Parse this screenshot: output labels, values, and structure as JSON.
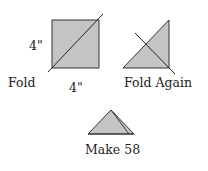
{
  "diagram": {
    "step1": {
      "label": "Fold",
      "side_label_left": "4\"",
      "side_label_bottom": "4\""
    },
    "step2": {
      "label": "Fold Again"
    },
    "step3": {
      "label": "Make 58"
    }
  },
  "colors": {
    "fill": "#c4c4c4",
    "stroke": "#333333"
  }
}
